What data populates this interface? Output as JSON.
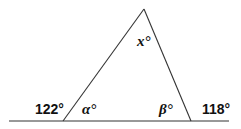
{
  "diagram": {
    "type": "triangle-exterior-angles",
    "line_color": "#333333",
    "labels": {
      "apex_angle": "x°",
      "left_interior": "α°",
      "right_interior": "β°",
      "left_exterior": "122°",
      "right_exterior": "118°"
    }
  }
}
